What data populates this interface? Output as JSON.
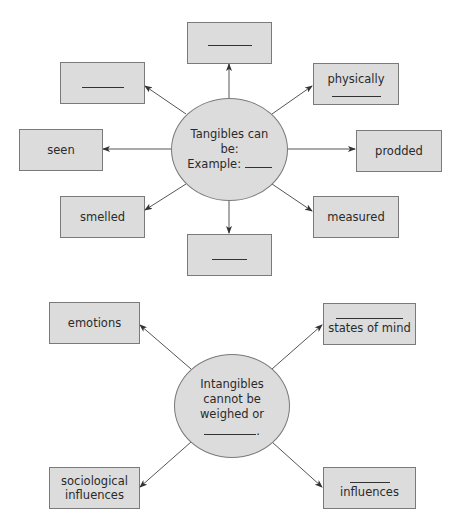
{
  "diagram1": {
    "center": {
      "line1": "Tangibles can",
      "line2": "be:",
      "line3_prefix": "Example:",
      "line3_blank": "____"
    },
    "nodes": {
      "top": {
        "label": "______"
      },
      "upper_left": {
        "label": "______"
      },
      "upper_right": {
        "label": "physically",
        "blank": "________"
      },
      "left": {
        "label": "seen"
      },
      "right": {
        "label": "prodded"
      },
      "lower_left": {
        "label": "smelled"
      },
      "lower_right": {
        "label": "measured"
      },
      "bottom": {
        "label": "_____"
      }
    }
  },
  "diagram2": {
    "center": {
      "line1": "Intangibles",
      "line2": "cannot be",
      "line3": "weighed or",
      "line4_blank": "_________",
      "line4_suffix": "."
    },
    "nodes": {
      "upper_left": {
        "label": "emotions"
      },
      "upper_right": {
        "blank": "__________",
        "label": "states of mind"
      },
      "lower_left": {
        "line1": "sociological",
        "line2": "influences"
      },
      "lower_right": {
        "blank": "______",
        "label": "influences"
      }
    }
  },
  "colors": {
    "fill": "#dcdcdc",
    "border": "#7a7a7a",
    "arrow": "#444444"
  }
}
